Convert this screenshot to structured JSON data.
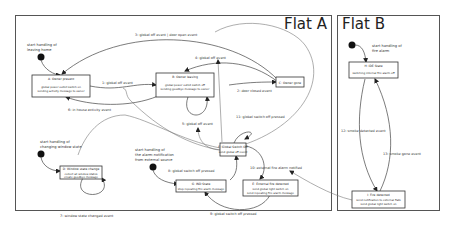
{
  "flats": [
    {
      "title": "Flat A"
    },
    {
      "title": "Flat B"
    }
  ],
  "start_notes": [
    {
      "lines": [
        "start handling of",
        "leaving home"
      ]
    },
    {
      "lines": [
        "start handling of",
        "changing window state"
      ]
    },
    {
      "lines": [
        "start handling of",
        "the alarm-notification",
        "from external source"
      ]
    },
    {
      "lines": [
        "start handling of",
        "fire alarm"
      ]
    }
  ],
  "states": [
    {
      "id": "A",
      "title": "A: Owner present",
      "body": [
        "global power outlet switch on",
        "sending activity message to owner"
      ]
    },
    {
      "id": "B",
      "title": "B: Owner leaving",
      "body": [
        "global power outlet switch off",
        "sending goodbye message to owner"
      ]
    },
    {
      "id": "C",
      "title": "C: Owner gone",
      "body": []
    },
    {
      "id": "D",
      "title": "D: Window state change",
      "body": [
        "collect all window states",
        "create goodbye message"
      ]
    },
    {
      "id": "E",
      "title": "E: External fire detected",
      "body": [
        "send global light switch on",
        "send repeating fire alarm message"
      ]
    },
    {
      "id": "F",
      "title": "F: Global Switch Off",
      "body": [
        "send global off event"
      ]
    },
    {
      "id": "G",
      "title": "G: IND State",
      "body": [
        "stop repeating fire alarm message"
      ]
    },
    {
      "id": "H",
      "title": "H: IDE State",
      "body": [
        "switching internal fire alarm off"
      ]
    },
    {
      "id": "I",
      "title": "I: Fire detected",
      "body": [
        "send notification to external flats",
        "send global light switch on"
      ]
    }
  ],
  "transitions": [
    {
      "label": "1: global off event"
    },
    {
      "label": "2: door closed event"
    },
    {
      "label": "3: global off event | door open event"
    },
    {
      "label": "4: global off event"
    },
    {
      "label": "5: global off event"
    },
    {
      "label": "6: in house activity event"
    },
    {
      "label": "7: window state changed event"
    },
    {
      "label": "8: global switch off pressed"
    },
    {
      "label": "9: global switch off pressed"
    },
    {
      "label": "10: external fire alarm notified"
    },
    {
      "label": "11: global switch off pressed"
    },
    {
      "label": "12: smoke detected event"
    },
    {
      "label": "13: smoke gone event"
    }
  ]
}
